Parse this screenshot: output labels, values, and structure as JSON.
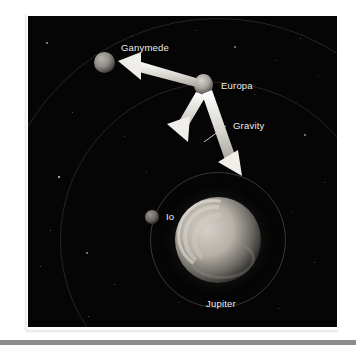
{
  "figure": {
    "title_alt": "Jupiter and its moons with gravity arrows",
    "background_color": "#050505",
    "label_color": "#efeeea",
    "arrow_color": "#e8e6e0"
  },
  "labels": {
    "ganymede": "Ganymede",
    "europa": "Europa",
    "io": "Io",
    "jupiter": "Jupiter",
    "gravity": "Gravity"
  },
  "bodies": [
    {
      "name": "Jupiter",
      "label": "Jupiter",
      "type": "planet",
      "cx": 190,
      "cy": 224,
      "r": 43
    },
    {
      "name": "Ganymede",
      "label": "Ganymede",
      "type": "moon",
      "cx": 76,
      "cy": 46,
      "r": 10
    },
    {
      "name": "Europa",
      "label": "Europa",
      "type": "moon",
      "cx": 175,
      "cy": 69,
      "r": 10
    },
    {
      "name": "Io",
      "label": "Io",
      "type": "moon",
      "cx": 124,
      "cy": 201,
      "r": 7
    }
  ],
  "orbits": [
    {
      "name": "io-orbit",
      "cx": 190,
      "cy": 224,
      "r": 68
    },
    {
      "name": "europa-orbit",
      "cx": 190,
      "cy": 224,
      "r": 158
    },
    {
      "name": "ganymede-orbit",
      "cx": 190,
      "cy": 224,
      "r": 222
    }
  ],
  "arrows": [
    {
      "name": "arrow-to-ganymede",
      "from": [
        168,
        66
      ],
      "to": [
        96,
        44
      ],
      "meaning": "pull toward Ganymede"
    },
    {
      "name": "arrow-short-down",
      "from": [
        172,
        80
      ],
      "to": [
        148,
        118
      ],
      "meaning": "resultant tidal force"
    },
    {
      "name": "arrow-gravity",
      "from": [
        180,
        82
      ],
      "to": [
        202,
        152
      ],
      "meaning": "Gravity toward Jupiter",
      "label": "Gravity"
    }
  ],
  "gravity_leader": {
    "name": "gravity-leader-line",
    "from": [
      196,
      113
    ],
    "to": [
      176,
      127
    ]
  }
}
